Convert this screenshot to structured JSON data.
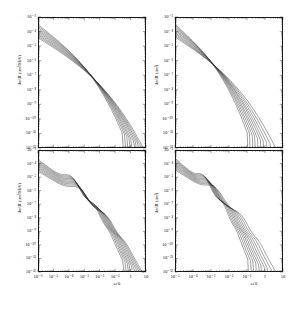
{
  "figure": {
    "background": "#ffffff",
    "curve_color": "#2a2a2a",
    "axis_color": "#1a1a1a",
    "panel_count": 4,
    "layout": "2x2 grid of log-log differential cross section plots"
  },
  "chart_data": [
    {
      "id": "top-left",
      "type": "line",
      "title": "",
      "xlabel": "ω/θ",
      "ylabel": "dσ/dT (cm²/MeV)",
      "xscale": "log",
      "yscale": "log",
      "xlim": [
        1e-06,
        10
      ],
      "ylim": [
        1e-12,
        0.001
      ],
      "xticks": [
        "10⁻⁶",
        "10⁻⁵",
        "10⁻⁴",
        "10⁻³",
        "10⁻²",
        "10⁻¹",
        "1",
        "10"
      ],
      "yticks": [
        "10⁻³",
        "10⁻⁴",
        "10⁻⁵",
        "10⁻⁶",
        "10⁻⁷",
        "10⁻⁸",
        "10⁻⁹",
        "10⁻¹⁰",
        "10⁻¹¹",
        "10⁻¹²"
      ],
      "grid": false,
      "legend": "none",
      "n_series": 10,
      "description": "Family of ten nearly parallel power-law curves falling from upper-left to lower-right, steepening and then cutting off vertically at staggered high-x values",
      "series": [
        {
          "name": "curve-1",
          "cutoff_x": 0.3,
          "y_at_xmin": 0.0003
        },
        {
          "name": "curve-2",
          "cutoff_x": 0.42,
          "y_at_xmin": 0.00024
        },
        {
          "name": "curve-3",
          "cutoff_x": 0.58,
          "y_at_xmin": 0.00019
        },
        {
          "name": "curve-4",
          "cutoff_x": 0.8,
          "y_at_xmin": 0.00015
        },
        {
          "name": "curve-5",
          "cutoff_x": 1.1,
          "y_at_xmin": 0.00012
        },
        {
          "name": "curve-6",
          "cutoff_x": 1.55,
          "y_at_xmin": 9.5e-05
        },
        {
          "name": "curve-7",
          "cutoff_x": 2.15,
          "y_at_xmin": 7.5e-05
        },
        {
          "name": "curve-8",
          "cutoff_x": 3.0,
          "y_at_xmin": 6e-05
        },
        {
          "name": "curve-9",
          "cutoff_x": 4.2,
          "y_at_xmin": 4.8e-05
        },
        {
          "name": "curve-10",
          "cutoff_x": 6.0,
          "y_at_xmin": 3.8e-05
        }
      ]
    },
    {
      "id": "top-right",
      "type": "line",
      "title": "",
      "xlabel": "ω/θ",
      "ylabel": "dσ/dT (cm²)",
      "xscale": "log",
      "yscale": "log",
      "xlim": [
        1e-05,
        10
      ],
      "ylim": [
        1e-12,
        0.001
      ],
      "xticks": [
        "10⁻⁵",
        "10⁻⁴",
        "10⁻³",
        "10⁻²",
        "10⁻¹",
        "1",
        "10"
      ],
      "yticks": [
        "10⁻³",
        "10⁻⁴",
        "10⁻⁵",
        "10⁻⁶",
        "10⁻⁷",
        "10⁻⁸",
        "10⁻⁹",
        "10⁻¹⁰",
        "10⁻¹¹",
        "10⁻¹²"
      ],
      "grid": false,
      "legend": "none",
      "n_series": 10,
      "description": "Ten power-law curves descending from upper-left, each bending sharply into a near-vertical drop at progressively larger x",
      "series": [
        {
          "name": "curve-1",
          "cutoff_x": 0.105,
          "y_at_xmin": 0.00032
        },
        {
          "name": "curve-2",
          "cutoff_x": 0.145,
          "y_at_xmin": 0.00026
        },
        {
          "name": "curve-3",
          "cutoff_x": 0.2,
          "y_at_xmin": 0.00021
        },
        {
          "name": "curve-4",
          "cutoff_x": 0.28,
          "y_at_xmin": 0.00017
        },
        {
          "name": "curve-5",
          "cutoff_x": 0.39,
          "y_at_xmin": 0.000135
        },
        {
          "name": "curve-6",
          "cutoff_x": 0.56,
          "y_at_xmin": 0.00011
        },
        {
          "name": "curve-7",
          "cutoff_x": 0.82,
          "y_at_xmin": 8.5e-05
        },
        {
          "name": "curve-8",
          "cutoff_x": 1.25,
          "y_at_xmin": 6.8e-05
        },
        {
          "name": "curve-9",
          "cutoff_x": 2.0,
          "y_at_xmin": 5.4e-05
        },
        {
          "name": "curve-10",
          "cutoff_x": 3.4,
          "y_at_xmin": 4.3e-05
        }
      ]
    },
    {
      "id": "bottom-left",
      "type": "line",
      "title": "",
      "xlabel": "ω/θ",
      "ylabel": "dσ/dT (cm²/MeV)",
      "xscale": "log",
      "yscale": "log",
      "xlim": [
        1e-06,
        10
      ],
      "ylim": [
        1e-12,
        0.001
      ],
      "xticks": [
        "10⁻⁶",
        "10⁻⁵",
        "10⁻⁴",
        "10⁻³",
        "10⁻²",
        "10⁻¹",
        "1",
        "10"
      ],
      "yticks": [
        "10⁻³",
        "10⁻⁴",
        "10⁻⁵",
        "10⁻⁶",
        "10⁻⁷",
        "10⁻⁸",
        "10⁻⁹",
        "10⁻¹⁰",
        "10⁻¹¹",
        "10⁻¹²"
      ],
      "grid": false,
      "legend": "none",
      "n_series": 10,
      "description": "Ten curves with pronounced oscillatory shoulder structure: a plateau near mid-range then a second shoulder before the steep staggered cutoff",
      "series": [
        {
          "name": "curve-1",
          "cutoff_x": 0.32,
          "y_at_xmin": 0.0002
        },
        {
          "name": "curve-2",
          "cutoff_x": 0.45,
          "y_at_xmin": 0.00016
        },
        {
          "name": "curve-3",
          "cutoff_x": 0.62,
          "y_at_xmin": 0.00013
        },
        {
          "name": "curve-4",
          "cutoff_x": 0.85,
          "y_at_xmin": 0.000105
        },
        {
          "name": "curve-5",
          "cutoff_x": 1.18,
          "y_at_xmin": 8.4e-05
        },
        {
          "name": "curve-6",
          "cutoff_x": 1.62,
          "y_at_xmin": 6.7e-05
        },
        {
          "name": "curve-7",
          "cutoff_x": 2.25,
          "y_at_xmin": 5.4e-05
        },
        {
          "name": "curve-8",
          "cutoff_x": 3.15,
          "y_at_xmin": 4.3e-05
        },
        {
          "name": "curve-9",
          "cutoff_x": 4.4,
          "y_at_xmin": 3.4e-05
        },
        {
          "name": "curve-10",
          "cutoff_x": 6.2,
          "y_at_xmin": 2.7e-05
        }
      ]
    },
    {
      "id": "bottom-right",
      "type": "line",
      "title": "",
      "xlabel": "ω/θ",
      "ylabel": "dσ/dT (cm²)",
      "xscale": "log",
      "yscale": "log",
      "xlim": [
        1e-05,
        10
      ],
      "ylim": [
        1e-12,
        0.001
      ],
      "xticks": [
        "10⁻⁵",
        "10⁻⁴",
        "10⁻³",
        "10⁻²",
        "10⁻¹",
        "1",
        "10"
      ],
      "yticks": [
        "10⁻³",
        "10⁻⁴",
        "10⁻⁵",
        "10⁻⁶",
        "10⁻⁷",
        "10⁻⁸",
        "10⁻⁹",
        "10⁻¹⁰",
        "10⁻¹¹",
        "10⁻¹²"
      ],
      "grid": false,
      "legend": "none",
      "n_series": 10,
      "description": "Ten curves with shoulder/oscillation structure that bend into near-vertical drops at staggered x positions spanning roughly 0.1 to 4",
      "series": [
        {
          "name": "curve-1",
          "cutoff_x": 0.115,
          "y_at_xmin": 0.00024
        },
        {
          "name": "curve-2",
          "cutoff_x": 0.16,
          "y_at_xmin": 0.000195
        },
        {
          "name": "curve-3",
          "cutoff_x": 0.225,
          "y_at_xmin": 0.00016
        },
        {
          "name": "curve-4",
          "cutoff_x": 0.315,
          "y_at_xmin": 0.00013
        },
        {
          "name": "curve-5",
          "cutoff_x": 0.44,
          "y_at_xmin": 0.000105
        },
        {
          "name": "curve-6",
          "cutoff_x": 0.63,
          "y_at_xmin": 8.4e-05
        },
        {
          "name": "curve-7",
          "cutoff_x": 0.92,
          "y_at_xmin": 6.8e-05
        },
        {
          "name": "curve-8",
          "cutoff_x": 1.4,
          "y_at_xmin": 5.4e-05
        },
        {
          "name": "curve-9",
          "cutoff_x": 2.25,
          "y_at_xmin": 4.3e-05
        },
        {
          "name": "curve-10",
          "cutoff_x": 3.8,
          "y_at_xmin": 3.4e-05
        }
      ]
    }
  ]
}
